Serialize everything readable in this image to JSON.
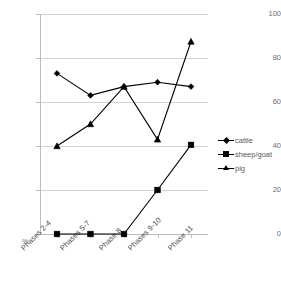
{
  "chart_data": {
    "type": "line",
    "title": "",
    "xlabel": "",
    "ylabel": "%",
    "ylim": [
      0,
      100
    ],
    "yticks": [
      0,
      20,
      40,
      60,
      80,
      100
    ],
    "grid": true,
    "legend_position": "right",
    "categories": [
      "Phases 2-4",
      "Phases 5-7",
      "Phase 8",
      "Phases 9-10",
      "Phase 11"
    ],
    "series": [
      {
        "name": "cattle",
        "marker": "diamond",
        "color": "#000000",
        "values": [
          73,
          63,
          67,
          69,
          67
        ]
      },
      {
        "name": "sheep/goat",
        "marker": "square",
        "color": "#000000",
        "values": [
          0,
          0,
          0,
          20,
          40.5
        ]
      },
      {
        "name": "pig",
        "marker": "triangle",
        "color": "#000000",
        "values": [
          40,
          50,
          67,
          43,
          87.5
        ]
      }
    ]
  },
  "axis": {
    "y_labels": [
      "100",
      "80",
      "60",
      "40",
      "20",
      "0"
    ],
    "percent_symbol": "%"
  },
  "legend": {
    "items": [
      {
        "label": "cattle"
      },
      {
        "label": "sheep/goat"
      },
      {
        "label": "pig"
      }
    ]
  },
  "colors": {
    "line": "#000000",
    "gridline": "#d2d2d2",
    "axis": "#bdbdbd",
    "tick_text": "#6e6e6e",
    "category_text": "#4a4a4a",
    "background": "#ffffff"
  }
}
